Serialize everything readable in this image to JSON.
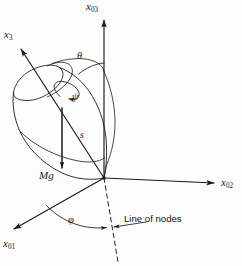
{
  "figure": {
    "background_color": "#fdfdfd",
    "stroke_color": "#1a1a1a",
    "width": 242,
    "height": 266
  },
  "axes": [
    {
      "id": "x03",
      "symbol": "x",
      "subscript": "03",
      "description": "vertical space-fixed axis",
      "from": [
        104,
        178
      ],
      "to": [
        104,
        18
      ]
    },
    {
      "id": "x3",
      "symbol": "x",
      "subscript": "3",
      "description": "body symmetry axis of the top",
      "from": [
        104,
        178
      ],
      "to": [
        19,
        47
      ]
    },
    {
      "id": "x02",
      "symbol": "x",
      "subscript": "02",
      "description": "horizontal space-fixed axis to the right",
      "from": [
        104,
        178
      ],
      "to": [
        216,
        183
      ]
    },
    {
      "id": "x01",
      "symbol": "x",
      "subscript": "01",
      "description": "space-fixed axis toward lower left",
      "from": [
        104,
        178
      ],
      "to": [
        12,
        230
      ]
    }
  ],
  "angles": [
    {
      "id": "theta",
      "label": "θ",
      "description": "nutation angle between x3 and x03"
    },
    {
      "id": "psi",
      "label": "ψ",
      "description": "spin angle about the body axis x3"
    },
    {
      "id": "phi",
      "label": "φ",
      "description": "precession angle between x01 and the line of nodes"
    }
  ],
  "vectors": [
    {
      "id": "mg",
      "label": "Mg",
      "description": "gravitational force acting downward at the center of mass"
    },
    {
      "id": "s",
      "label": "s",
      "description": "distance from the pivot to the center of mass"
    }
  ],
  "annotations": [
    {
      "id": "line-of-nodes",
      "label": "Line of nodes",
      "description": "dashed line marking the intersection of the body and space planes"
    }
  ],
  "labels": {
    "x03": "x",
    "x03_sub": "03",
    "x3": "x",
    "x3_sub": "3",
    "x02": "x",
    "x02_sub": "02",
    "x01": "x",
    "x01_sub": "01",
    "theta": "θ",
    "psi": "ψ",
    "s": "s",
    "mg": "Mg",
    "phi": "φ",
    "line_of_nodes": "Line of nodes"
  }
}
